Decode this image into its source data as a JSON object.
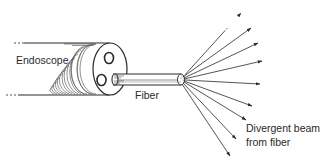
{
  "diagram": {
    "labels": {
      "endoscope": "Endoscope",
      "fiber": "Fiber",
      "beam_line1": "Divergent beam",
      "beam_line2": "from fiber"
    },
    "colors": {
      "ink": "#2a2a2a",
      "background": "#ffffff"
    },
    "components": [
      "endoscope",
      "fiber",
      "fiber-tip",
      "divergent-beam-arrows"
    ],
    "arrow_count": 9
  }
}
